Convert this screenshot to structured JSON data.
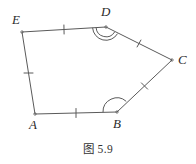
{
  "figure": {
    "caption": "图 5.9",
    "stroke_color": "#5a5a5a",
    "label_color": "#2b2b2b",
    "background_color": "#ffffff",
    "shape": "pentagon",
    "vertices": [
      {
        "name": "A",
        "label": "A",
        "x": 35,
        "y": 114,
        "label_x": 29,
        "label_y": 118
      },
      {
        "name": "B",
        "label": "B",
        "x": 117,
        "y": 112,
        "label_x": 113,
        "label_y": 117
      },
      {
        "name": "C",
        "label": "C",
        "x": 172,
        "y": 60,
        "label_x": 178,
        "label_y": 53
      },
      {
        "name": "D",
        "label": "D",
        "x": 106,
        "y": 27,
        "label_x": 101,
        "label_y": 5
      },
      {
        "name": "E",
        "label": "E",
        "x": 22,
        "y": 32,
        "label_x": 12,
        "label_y": 13
      }
    ],
    "edges": [
      {
        "name": "edge-AB",
        "from": "A",
        "to": "B",
        "tick_count": 1
      },
      {
        "name": "edge-BC",
        "from": "B",
        "to": "C",
        "tick_count": 1
      },
      {
        "name": "edge-CD",
        "from": "C",
        "to": "D",
        "tick_count": 1
      },
      {
        "name": "edge-DE",
        "from": "D",
        "to": "E",
        "tick_count": 1
      },
      {
        "name": "edge-EA",
        "from": "E",
        "to": "A",
        "tick_count": 1
      }
    ],
    "angle_marks": [
      {
        "name": "angle-D",
        "vertex": "D",
        "arc_count": 2
      },
      {
        "name": "angle-B",
        "vertex": "B",
        "arc_count": 1
      }
    ]
  }
}
